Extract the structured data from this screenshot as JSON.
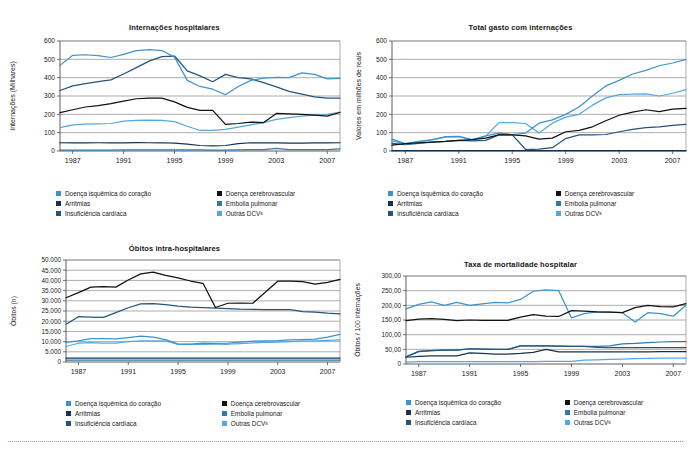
{
  "figure": {
    "background": "#ffffff",
    "line_colors": {
      "doenca_isquemica": "#3d93cd",
      "doenca_cerebrovascular": "#111111",
      "arritmias": "#17324f",
      "embolia_pulmonar": "#2f79ab",
      "insuficiencia_cardiaca": "#24547e",
      "outras_dcv": "#55a8dd"
    },
    "grid_color": "#808080",
    "axis_color": "#4d4d4d"
  },
  "legend": {
    "items": [
      {
        "label": "Doença isquêmica do coração",
        "color": "#3d93cd",
        "key": "doenca-isquemica"
      },
      {
        "label": "Doença cerebrovascular",
        "color": "#111111",
        "key": "doenca-cerebrovascular"
      },
      {
        "label": "Arritmias",
        "color": "#17324f",
        "key": "arritmias"
      },
      {
        "label": "Embolia pulmonar",
        "color": "#2f79ab",
        "key": "embolia-pulmonar"
      },
      {
        "label": "Insuficiência cardíaca",
        "color": "#24547e",
        "key": "insuficiencia-cardiaca"
      },
      {
        "label": "Outras DCV",
        "suffix": "s",
        "color": "#55a8dd",
        "key": "outras-dcv"
      }
    ]
  },
  "chart_data": [
    {
      "id": "internacoes-hospitalares",
      "type": "line",
      "title": "Internações hospitalares",
      "xlabel": "",
      "ylabel": "Internações (Milhares)",
      "x": [
        1986,
        1987,
        1988,
        1989,
        1990,
        1991,
        1992,
        1993,
        1994,
        1995,
        1996,
        1997,
        1998,
        1999,
        2000,
        2001,
        2002,
        2003,
        2004,
        2005,
        2006,
        2007,
        2008
      ],
      "xticks": [
        1987,
        1991,
        1995,
        1999,
        2003,
        2007
      ],
      "ylim": [
        0,
        600
      ],
      "yticks": [
        0,
        100,
        200,
        300,
        400,
        500,
        600
      ],
      "ytick_labels": [
        "0",
        "100",
        "200",
        "300",
        "400",
        "500",
        "600"
      ],
      "grid": true,
      "legend_position": "below",
      "series": [
        {
          "name": "Doença isquêmica do coração",
          "color": "#3d93cd",
          "values": [
            467,
            522,
            525,
            520,
            510,
            527,
            548,
            553,
            548,
            512,
            385,
            352,
            337,
            307,
            352,
            385,
            398,
            401,
            400,
            426,
            418,
            393,
            396
          ]
        },
        {
          "name": "Doença cerebrovascular",
          "color": "#111111",
          "values": [
            209,
            225,
            240,
            247,
            258,
            272,
            285,
            288,
            288,
            268,
            238,
            221,
            222,
            145,
            150,
            158,
            155,
            205,
            203,
            200,
            196,
            190,
            210
          ]
        },
        {
          "name": "Arritmias",
          "color": "#17324f",
          "values": [
            45,
            44,
            44,
            45,
            45,
            45,
            46,
            45,
            45,
            43,
            38,
            30,
            28,
            30,
            40,
            45,
            45,
            44,
            43,
            43,
            44,
            44,
            45
          ]
        },
        {
          "name": "Embolia pulmonar",
          "color": "#2f79ab",
          "values": [
            5,
            5,
            5,
            5,
            5,
            6,
            6,
            6,
            6,
            6,
            6,
            6,
            5,
            5,
            6,
            7,
            8,
            14,
            8,
            7,
            7,
            8,
            12
          ]
        },
        {
          "name": "Insuficiência cardíaca",
          "color": "#24547e",
          "values": [
            330,
            355,
            367,
            378,
            388,
            420,
            455,
            490,
            515,
            518,
            437,
            410,
            378,
            418,
            400,
            393,
            373,
            350,
            325,
            310,
            295,
            288,
            288
          ]
        },
        {
          "name": "Outras DCVs",
          "color": "#55a8dd",
          "values": [
            128,
            142,
            147,
            148,
            150,
            163,
            167,
            168,
            167,
            160,
            135,
            112,
            112,
            118,
            130,
            143,
            155,
            172,
            182,
            190,
            196,
            200,
            212
          ]
        }
      ]
    },
    {
      "id": "total-gasto-com-internacoes",
      "type": "line",
      "title": "Total gasto com internações",
      "xlabel": "",
      "ylabel": "Valores em milhões de reais",
      "x": [
        1986,
        1987,
        1988,
        1989,
        1990,
        1991,
        1992,
        1993,
        1994,
        1995,
        1996,
        1997,
        1998,
        1999,
        2000,
        2001,
        2002,
        2003,
        2004,
        2005,
        2006,
        2007,
        2008
      ],
      "xticks": [
        1987,
        1991,
        1995,
        1999,
        2003,
        2007
      ],
      "ylim": [
        0,
        600
      ],
      "yticks": [
        0,
        100,
        200,
        300,
        400,
        500,
        600
      ],
      "ytick_labels": [
        "0",
        "100",
        "200",
        "300",
        "400",
        "500",
        "600"
      ],
      "grid": true,
      "legend_position": "below",
      "series": [
        {
          "name": "Doença isquêmica do coração",
          "color": "#3d93cd",
          "values": [
            65,
            40,
            52,
            62,
            78,
            80,
            62,
            82,
            98,
            90,
            98,
            152,
            170,
            200,
            240,
            300,
            355,
            385,
            420,
            440,
            465,
            480,
            500
          ]
        },
        {
          "name": "Doença cerebrovascular",
          "color": "#111111",
          "values": [
            32,
            40,
            45,
            48,
            52,
            58,
            62,
            70,
            88,
            88,
            82,
            65,
            70,
            105,
            112,
            132,
            165,
            195,
            212,
            225,
            215,
            228,
            232
          ]
        },
        {
          "name": "Arritmias",
          "color": "#17324f",
          "values": [
            2,
            2,
            2,
            2,
            2,
            2,
            2,
            2,
            2,
            2,
            2,
            2,
            2,
            2,
            2,
            2,
            2,
            2,
            2,
            2,
            2,
            2,
            2
          ]
        },
        {
          "name": "Embolia pulmonar",
          "color": "#2f79ab",
          "values": [
            2,
            2,
            2,
            2,
            2,
            2,
            2,
            2,
            2,
            2,
            2,
            2,
            2,
            2,
            2,
            2,
            2,
            2,
            2,
            2,
            2,
            2,
            2
          ]
        },
        {
          "name": "Insuficiência cardíaca",
          "color": "#24547e",
          "values": [
            42,
            35,
            42,
            48,
            52,
            58,
            55,
            58,
            88,
            88,
            8,
            10,
            18,
            68,
            88,
            88,
            90,
            105,
            118,
            128,
            132,
            140,
            145
          ]
        },
        {
          "name": "Outras DCVs",
          "color": "#55a8dd",
          "values": [
            55,
            38,
            50,
            60,
            75,
            78,
            60,
            80,
            155,
            155,
            150,
            98,
            152,
            185,
            200,
            250,
            290,
            308,
            310,
            312,
            300,
            315,
            335
          ]
        }
      ]
    },
    {
      "id": "obitos-intra-hospitalares",
      "type": "line",
      "title": "Óbitos intra-hospitalares",
      "xlabel": "",
      "ylabel": "Óbitos (n)",
      "x": [
        1986,
        1987,
        1988,
        1989,
        1990,
        1991,
        1992,
        1993,
        1994,
        1995,
        1996,
        1997,
        1998,
        1999,
        2000,
        2001,
        2002,
        2003,
        2004,
        2005,
        2006,
        2007,
        2008
      ],
      "xticks": [
        1987,
        1991,
        1995,
        1999,
        2003,
        2007
      ],
      "ylim": [
        0,
        50000
      ],
      "yticks": [
        0,
        5000,
        10000,
        15000,
        20000,
        25000,
        30000,
        35000,
        40000,
        45000,
        50000
      ],
      "ytick_labels": [
        "0",
        "5.000",
        "10.000",
        "15.000",
        "20.000",
        "25.000",
        "30.000",
        "35.000",
        "40.000",
        "45.000",
        "50.000"
      ],
      "grid": true,
      "legend_position": "below",
      "series": [
        {
          "name": "Doença isquêmica do coração",
          "color": "#3d93cd",
          "values": [
            9600,
            10400,
            11500,
            11400,
            11300,
            12000,
            12700,
            12200,
            11000,
            8800,
            8800,
            9200,
            9100,
            9300,
            9800,
            10200,
            10300,
            10500,
            10900,
            11000,
            11200,
            12200,
            13500
          ]
        },
        {
          "name": "Doença cerebrovascular",
          "color": "#111111",
          "values": [
            31500,
            34000,
            36700,
            37000,
            36700,
            40200,
            43200,
            44100,
            42500,
            41200,
            39700,
            38600,
            26700,
            28800,
            28900,
            28800,
            34200,
            39600,
            39700,
            39400,
            38200,
            39000,
            40500
          ]
        },
        {
          "name": "Arritmias",
          "color": "#17324f",
          "values": [
            1900,
            1900,
            1900,
            1900,
            1900,
            1900,
            1900,
            1900,
            1900,
            1900,
            1900,
            1900,
            1900,
            1900,
            1900,
            1900,
            1900,
            1900,
            1900,
            1900,
            1900,
            1900,
            1900
          ]
        },
        {
          "name": "Embolia pulmonar",
          "color": "#2f79ab",
          "values": [
            900,
            900,
            900,
            900,
            900,
            900,
            900,
            900,
            900,
            900,
            900,
            900,
            900,
            900,
            900,
            900,
            900,
            900,
            900,
            900,
            900,
            900,
            900
          ]
        },
        {
          "name": "Insuficiência cardíaca",
          "color": "#24547e",
          "values": [
            18500,
            22200,
            22000,
            21900,
            24200,
            26600,
            28500,
            28600,
            28100,
            27400,
            26900,
            26600,
            26400,
            26200,
            25900,
            25800,
            25700,
            25700,
            25700,
            24700,
            24400,
            23900,
            23600
          ]
        },
        {
          "name": "Outras DCVs",
          "color": "#55a8dd",
          "values": [
            7600,
            9200,
            9500,
            9300,
            9200,
            10000,
            10400,
            10300,
            10400,
            8600,
            8600,
            8600,
            8700,
            8700,
            9000,
            9400,
            9600,
            9800,
            10000,
            10200,
            10400,
            10600,
            10900
          ]
        }
      ]
    },
    {
      "id": "taxa-de-mortalidade-hospitalar",
      "type": "line",
      "title": "Taxa de mortalidade hospitalar",
      "xlabel": "",
      "ylabel": "Óbitos / 100 internações",
      "x": [
        1986,
        1987,
        1988,
        1989,
        1990,
        1991,
        1992,
        1993,
        1994,
        1995,
        1996,
        1997,
        1998,
        1999,
        2000,
        2001,
        2002,
        2003,
        2004,
        2005,
        2006,
        2007,
        2008
      ],
      "xticks": [
        1987,
        1991,
        1995,
        1999,
        2003,
        2007
      ],
      "ylim": [
        0,
        300
      ],
      "yticks": [
        0,
        50,
        100,
        150,
        200,
        250,
        300
      ],
      "ytick_labels": [
        "0",
        "50,00",
        "100,00",
        "150,00",
        "200,00",
        "250,00",
        "300,00"
      ],
      "grid": true,
      "legend_position": "below",
      "series": [
        {
          "name": "Doença isquêmica do coração",
          "color": "#3d93cd",
          "values": [
            188,
            203,
            212,
            200,
            210,
            200,
            205,
            210,
            208,
            220,
            248,
            253,
            250,
            157,
            172,
            178,
            177,
            175,
            143,
            175,
            172,
            163,
            200
          ]
        },
        {
          "name": "Doença cerebrovascular",
          "color": "#111111",
          "values": [
            148,
            153,
            155,
            152,
            148,
            150,
            149,
            149,
            149,
            160,
            168,
            163,
            162,
            182,
            180,
            178,
            177,
            175,
            192,
            200,
            196,
            195,
            206
          ]
        },
        {
          "name": "Arritmias",
          "color": "#17324f",
          "values": [
            23,
            26,
            28,
            28,
            28,
            38,
            36,
            34,
            34,
            36,
            40,
            50,
            41,
            41,
            41,
            41,
            41,
            41,
            41,
            41,
            42,
            42,
            42
          ]
        },
        {
          "name": "Embolia pulmonar",
          "color": "#2f79ab",
          "values": [
            25,
            42,
            46,
            47,
            47,
            52,
            51,
            50,
            50,
            62,
            62,
            62,
            61,
            60,
            60,
            60,
            62,
            69,
            70,
            73,
            75,
            76,
            76
          ]
        },
        {
          "name": "Insuficiência cardíaca",
          "color": "#24547e",
          "values": [
            24,
            43,
            46,
            47,
            47,
            52,
            51,
            50,
            50,
            62,
            62,
            62,
            61,
            60,
            60,
            57,
            56,
            56,
            56,
            56,
            56,
            56,
            56
          ]
        },
        {
          "name": "Outras DCVs",
          "color": "#55a8dd",
          "values": [
            6,
            8,
            8,
            8,
            8,
            8,
            8,
            8,
            8,
            8,
            8,
            9,
            9,
            9,
            13,
            14,
            16,
            17,
            18,
            19,
            20,
            20,
            20
          ]
        }
      ]
    }
  ]
}
